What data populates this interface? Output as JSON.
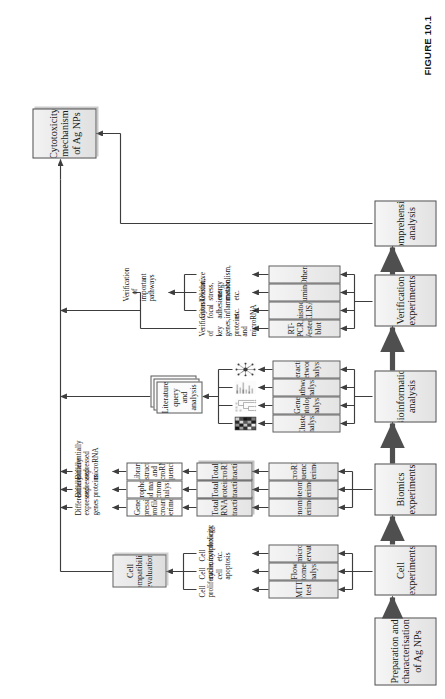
{
  "figure": {
    "caption": "FIGURE 10.1",
    "final_node": "Cytotoxicity mechanism of Ag NPs"
  },
  "stages": [
    {
      "id": "prep",
      "label": "Preparation and characterisation of Ag NPs"
    },
    {
      "id": "cell",
      "label": "Cell experiments"
    },
    {
      "id": "biom",
      "label": "Biomics experiments"
    },
    {
      "id": "bioinf",
      "label": "Bioinformatics analysis"
    },
    {
      "id": "verif",
      "label": "Verification experiments"
    },
    {
      "id": "comp",
      "label": "Comprehensive analysis"
    }
  ],
  "cell_experiments": {
    "methods": [
      "MTT test",
      "Flow cytometry analysis",
      "SEM/microscopy observation"
    ],
    "outcomes": [
      "Cell proliferation/cytotoxicity",
      "Cell cycle, cell apoptosis",
      "Cell morphology, etc."
    ],
    "evaluation": "Cell compatibility evaluation"
  },
  "biomics_experiments": {
    "methods": [
      "Genomics experiments",
      "Proteomics experiments",
      "MicroRNA sequencing experiments"
    ],
    "extractions": [
      "Total RNA extraction",
      "Total protein extraction",
      "Total microRNA extraction"
    ],
    "assays": [
      "Gene expression profile microarray experiments",
      "Electrophoresis and mass spectrometry analysis",
      "Library construction and microRNA sequencing"
    ],
    "outputs": [
      "Differentially expressed genes",
      "Differentially expressed proteins",
      "Differentially expressed microRNA"
    ]
  },
  "bioinformatics_analysis": {
    "methods": [
      "Cluster analysis",
      "Gene ontology analysis",
      "Pathway analysis",
      "Interaction network analysis"
    ],
    "thumbnails": [
      "heatmap-thumbnail",
      "cluster-dendrogram-thumbnail",
      "go-chart-thumbnail",
      "network-graph-thumbnail"
    ],
    "literature": "Literature query and analysis"
  },
  "verification_experiments": {
    "methods": [
      "RT-PCR, Western blot",
      "Immunohistochemical, ELISA",
      "Chemiluminescence",
      "Others"
    ],
    "targets": [
      "Verification of key genes, proteins and microRNA",
      "Cytoskeleton, focal adhesions, inflammation, etc.",
      "Oxidative stress, energy metabolism, etc.",
      "…"
    ],
    "summary": "Verification of important pathways"
  },
  "colors": {
    "box_border": "#5c5c5c",
    "box_fill": "#ededed",
    "line": "#3d3d3d",
    "arrow": "#4f4f4f"
  }
}
